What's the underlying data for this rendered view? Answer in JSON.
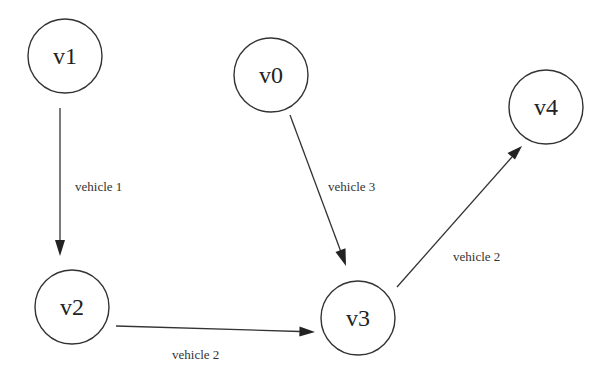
{
  "diagram": {
    "type": "directed-graph",
    "nodes": [
      {
        "id": "v1",
        "label": "v1"
      },
      {
        "id": "v0",
        "label": "v0"
      },
      {
        "id": "v4",
        "label": "v4"
      },
      {
        "id": "v2",
        "label": "v2"
      },
      {
        "id": "v3",
        "label": "v3"
      }
    ],
    "edges": [
      {
        "from": "v1",
        "to": "v2",
        "label": "vehicle 1"
      },
      {
        "from": "v0",
        "to": "v3",
        "label": "vehicle 3"
      },
      {
        "from": "v2",
        "to": "v3",
        "label": "vehicle 2"
      },
      {
        "from": "v3",
        "to": "v4",
        "label": "vehicle 2"
      }
    ],
    "colors": {
      "stroke": "#333333",
      "background": "#ffffff"
    }
  }
}
